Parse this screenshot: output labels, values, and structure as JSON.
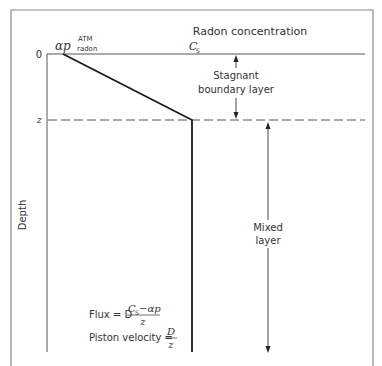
{
  "diagram": {
    "title": "Radon concentration",
    "x_axis_surface_label_symbol": "αp",
    "x_axis_surface_label_sup": "ATM",
    "x_axis_surface_label_sub": "radon",
    "x_axis_bulk_label": "C",
    "x_axis_bulk_label_sub": "S",
    "y_axis_label": "Depth",
    "y_tick_zero": "0",
    "y_tick_z": "z",
    "stagnant_label_line1": "Stagnant",
    "stagnant_label_line2": "boundary layer",
    "mixed_label_line1": "Mixed",
    "mixed_label_line2": "layer",
    "flux": {
      "prefix": "Flux = D",
      "numerator_c": "C",
      "numerator_sub": "S",
      "numerator_rest": "−αp",
      "denominator": "z"
    },
    "piston": {
      "prefix": "Piston velocity =",
      "numerator": "D",
      "denominator": "z"
    },
    "colors": {
      "frame": "#888888",
      "line": "#222222",
      "text": "#333333"
    }
  }
}
